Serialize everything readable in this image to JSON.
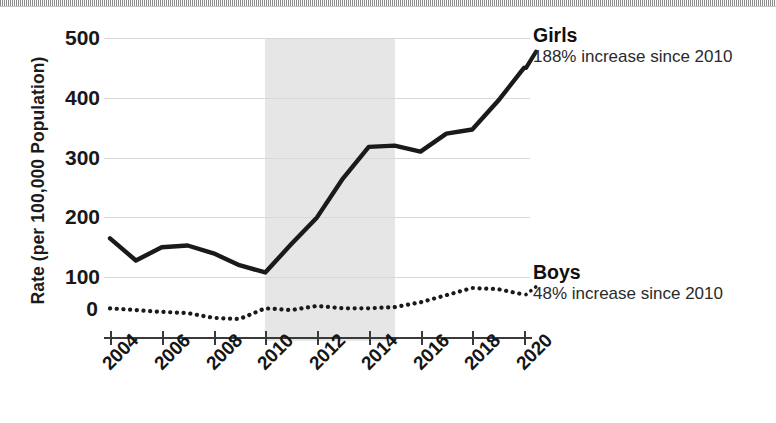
{
  "chart_data": {
    "type": "line",
    "title": "",
    "xlabel": "",
    "ylabel": "Rate (per 100,000 Population)",
    "x": [
      2004,
      2005,
      2006,
      2007,
      2008,
      2009,
      2010,
      2011,
      2012,
      2013,
      2014,
      2015,
      2016,
      2017,
      2018,
      2019,
      2020
    ],
    "xtick_labels": [
      "2004",
      "2006",
      "2008",
      "2010",
      "2012",
      "2014",
      "2016",
      "2018",
      "2020"
    ],
    "xtick_values": [
      2004,
      2006,
      2008,
      2010,
      2012,
      2014,
      2016,
      2018,
      2020
    ],
    "xlim": [
      2004,
      2020
    ],
    "ytick_labels": [
      "0",
      "100",
      "200",
      "300",
      "400",
      "500"
    ],
    "ytick_values": [
      0,
      100,
      200,
      300,
      400,
      500
    ],
    "ylim": [
      0,
      500
    ],
    "grid": "horizontal",
    "legend_position": "right-inline-annotations",
    "shaded_region": {
      "x_start": 2010,
      "x_end": 2015,
      "color": "#e6e6e6"
    },
    "series": [
      {
        "name": "Girls",
        "style": "solid",
        "color": "#1a1a1a",
        "values": [
          165,
          128,
          150,
          153,
          140,
          120,
          108,
          155,
          200,
          265,
          318,
          320,
          310,
          340,
          347,
          395,
          450
        ]
      },
      {
        "name": "Boys",
        "style": "dotted",
        "color": "#1a1a1a",
        "values": [
          48,
          45,
          42,
          40,
          32,
          30,
          48,
          45,
          52,
          48,
          48,
          50,
          58,
          70,
          82,
          80,
          71
        ]
      }
    ],
    "annotations": [
      {
        "name": "Girls",
        "title": "Girls",
        "subtitle": "188% increase since 2010"
      },
      {
        "name": "Boys",
        "title": "Boys",
        "subtitle": "48% increase since 2010"
      }
    ]
  },
  "axes": {
    "y_title": "Rate (per 100,000 Population)",
    "zero_label": "0"
  }
}
